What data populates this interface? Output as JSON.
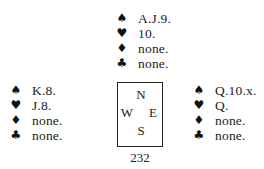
{
  "diagram": {
    "type": "bridge-deal",
    "hands": {
      "north": {
        "spades": "A.J.9.",
        "hearts": "10.",
        "diamonds": "none.",
        "clubs": "none."
      },
      "west": {
        "spades": "K.8.",
        "hearts": "J.8.",
        "diamonds": "none.",
        "clubs": "none."
      },
      "east": {
        "spades": "Q.10.x.",
        "hearts": "Q.",
        "diamonds": "none.",
        "clubs": "none."
      }
    },
    "compass": {
      "north": "N",
      "west": "W",
      "east": "E",
      "south": "S"
    },
    "icons": {
      "spades": "♠",
      "hearts": "♥",
      "diamonds": "♦",
      "clubs": "♣"
    }
  },
  "page": {
    "number": "232"
  }
}
